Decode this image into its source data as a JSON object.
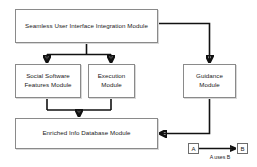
{
  "diagram": {
    "background_color": "#ffffff",
    "box_border_color": "#8a8a8a",
    "edge_color": "#111111",
    "nodes": [
      {
        "id": "seamless",
        "label": "Seamless User Interface Integration Module"
      },
      {
        "id": "social",
        "label": "Social Software Features Module"
      },
      {
        "id": "execution",
        "label": "Execution Module"
      },
      {
        "id": "guidance",
        "label": "Guidance Module"
      },
      {
        "id": "database",
        "label": "Enriched Info Database Module"
      }
    ],
    "edges": [
      {
        "from": "seamless",
        "to": "social",
        "style": "arrow"
      },
      {
        "from": "seamless",
        "to": "execution",
        "style": "arrow"
      },
      {
        "from": "seamless",
        "to": "guidance",
        "style": "arrow"
      },
      {
        "from": "social",
        "to": "database",
        "style": "arrow"
      },
      {
        "from": "execution",
        "to": "database",
        "style": "arrow"
      },
      {
        "from": "guidance",
        "to": "database",
        "style": "arrow"
      }
    ],
    "legend": {
      "source_label": "A",
      "target_label": "B",
      "caption": "A uses B"
    }
  }
}
